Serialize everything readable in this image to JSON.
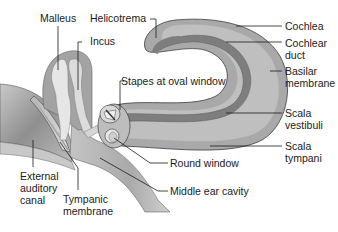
{
  "diagram": {
    "colors": {
      "background": "#ffffff",
      "cochlea_outer": "#a9a9a9",
      "scala_light": "#bdbdbd",
      "cochlear_duct": "#7e7e7e",
      "bone_gray": "#a3a3a3",
      "ossicle_light": "#e3e3e3",
      "cavity_gray": "#b8b8b8",
      "leader_line": "#1a1a1a",
      "text": "#1a1a1a"
    },
    "labels": [
      {
        "id": "malleus",
        "text": "Malleus"
      },
      {
        "id": "helicotrema",
        "text": "Helicotrema"
      },
      {
        "id": "incus",
        "text": "Incus"
      },
      {
        "id": "stapes",
        "text": "Stapes at oval window"
      },
      {
        "id": "cochlea",
        "text": "Cochlea"
      },
      {
        "id": "cochlear_duct",
        "text": "Cochlear\nduct"
      },
      {
        "id": "basilar_membrane",
        "text": "Basilar\nmembrane"
      },
      {
        "id": "scala_vestibuli",
        "text": "Scala\nvestibuli"
      },
      {
        "id": "scala_tympani",
        "text": "Scala\ntympani"
      },
      {
        "id": "round_window",
        "text": "Round window"
      },
      {
        "id": "middle_ear_cavity",
        "text": "Middle ear cavity"
      },
      {
        "id": "external_auditory_canal",
        "text": "External\nauditory\ncanal"
      },
      {
        "id": "tympanic_membrane",
        "text": "Tympanic\nmembrane"
      }
    ]
  }
}
